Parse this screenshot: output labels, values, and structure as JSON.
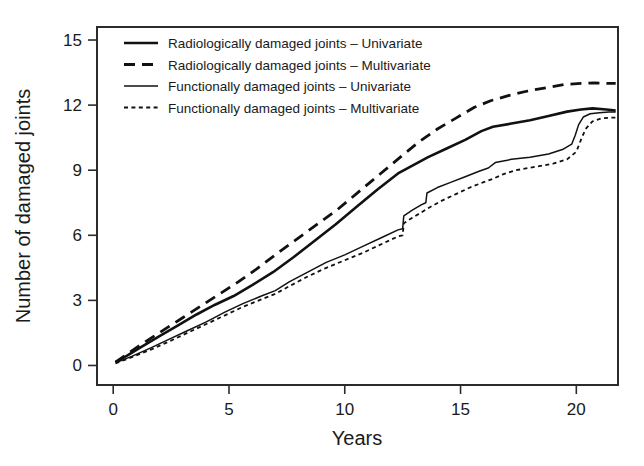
{
  "chart_data": {
    "type": "line",
    "title": "",
    "xlabel": "Years",
    "ylabel": "Number of damaged joints",
    "xlim": [
      -0.7,
      21.8
    ],
    "ylim": [
      -0.9,
      15.6
    ],
    "xticks": [
      0,
      5,
      10,
      15,
      20
    ],
    "xticklabels": [
      "0",
      "5",
      "10",
      "15",
      "20"
    ],
    "yticks": [
      0,
      3,
      6,
      9,
      12,
      15
    ],
    "yticklabels": [
      "0",
      "3",
      "6",
      "9",
      "12",
      "15"
    ],
    "grid": false,
    "legend_position": "top-left-inside",
    "series": [
      {
        "name": "Radiologically damaged joints – Univariate",
        "style": "solid",
        "width": 2.6,
        "color": "#111111",
        "x": [
          0.1,
          0.6,
          1.2,
          2.0,
          2.8,
          3.6,
          4.4,
          5.2,
          6.0,
          6.9,
          7.8,
          8.7,
          9.6,
          10.5,
          11.4,
          12.3,
          12.9,
          13.6,
          14.4,
          15.2,
          15.9,
          16.4,
          17.2,
          18.0,
          18.8,
          19.6,
          20.2,
          20.7,
          21.3,
          21.7
        ],
        "y": [
          0.15,
          0.45,
          0.85,
          1.35,
          1.85,
          2.35,
          2.8,
          3.2,
          3.7,
          4.3,
          5.0,
          5.75,
          6.5,
          7.3,
          8.1,
          8.85,
          9.2,
          9.6,
          10.0,
          10.4,
          10.8,
          11.0,
          11.15,
          11.3,
          11.5,
          11.7,
          11.8,
          11.85,
          11.8,
          11.75
        ]
      },
      {
        "name": "Radiologically damaged joints – Multivariate",
        "style": "dashed",
        "width": 2.8,
        "dash": "11,7",
        "color": "#111111",
        "x": [
          0.1,
          0.7,
          1.4,
          2.2,
          3.0,
          3.8,
          4.6,
          5.4,
          6.2,
          7.0,
          7.9,
          8.8,
          9.7,
          10.6,
          11.5,
          12.4,
          13.2,
          14.0,
          14.8,
          15.6,
          16.3,
          17.1,
          17.9,
          18.7,
          19.5,
          20.2,
          20.8,
          21.4,
          21.7
        ],
        "y": [
          0.15,
          0.6,
          1.1,
          1.65,
          2.2,
          2.75,
          3.3,
          3.85,
          4.45,
          5.1,
          5.8,
          6.5,
          7.2,
          8.0,
          8.8,
          9.6,
          10.3,
          10.9,
          11.4,
          11.9,
          12.2,
          12.45,
          12.65,
          12.8,
          12.95,
          13.0,
          13.02,
          13.0,
          13.0
        ]
      },
      {
        "name": "Functionally damaged joints – Univariate",
        "style": "solid",
        "width": 1.5,
        "color": "#111111",
        "x": [
          0.1,
          0.8,
          1.6,
          2.4,
          3.2,
          4.0,
          4.8,
          5.6,
          6.4,
          7.0,
          7.6,
          8.4,
          9.2,
          10.0,
          10.8,
          11.6,
          12.3,
          12.5,
          12.55,
          12.9,
          13.3,
          13.5,
          13.55,
          14.0,
          14.6,
          15.2,
          15.8,
          16.2,
          16.5,
          17.2,
          18.0,
          18.8,
          19.4,
          19.8,
          19.95,
          20.1,
          20.3,
          20.6,
          21.0,
          21.4,
          21.7
        ],
        "y": [
          0.12,
          0.42,
          0.8,
          1.2,
          1.6,
          2.0,
          2.45,
          2.85,
          3.2,
          3.45,
          3.85,
          4.3,
          4.75,
          5.1,
          5.5,
          5.9,
          6.25,
          6.3,
          6.9,
          7.15,
          7.4,
          7.5,
          7.95,
          8.2,
          8.45,
          8.7,
          8.95,
          9.1,
          9.35,
          9.5,
          9.6,
          9.75,
          9.95,
          10.2,
          10.6,
          11.1,
          11.45,
          11.6,
          11.65,
          11.68,
          11.68
        ]
      },
      {
        "name": "Functionally damaged joints – Multivariate",
        "style": "dotted",
        "width": 1.8,
        "dash": "4,3.4",
        "color": "#111111",
        "x": [
          0.1,
          0.8,
          1.6,
          2.4,
          3.2,
          4.0,
          4.8,
          5.6,
          6.4,
          7.0,
          7.6,
          8.4,
          9.2,
          10.0,
          10.8,
          11.6,
          12.3,
          12.5,
          12.55,
          12.9,
          13.3,
          13.6,
          14.2,
          14.8,
          15.4,
          16.0,
          16.4,
          16.8,
          17.4,
          18.2,
          19.0,
          19.6,
          20.0,
          20.2,
          20.4,
          20.7,
          21.1,
          21.5,
          21.7
        ],
        "y": [
          0.1,
          0.38,
          0.72,
          1.1,
          1.5,
          1.9,
          2.3,
          2.7,
          3.05,
          3.3,
          3.65,
          4.1,
          4.5,
          4.85,
          5.2,
          5.6,
          5.95,
          6.0,
          6.55,
          6.8,
          7.05,
          7.25,
          7.6,
          7.9,
          8.2,
          8.45,
          8.6,
          8.8,
          9.0,
          9.15,
          9.3,
          9.5,
          9.85,
          10.4,
          10.9,
          11.25,
          11.4,
          11.42,
          11.42
        ]
      }
    ]
  },
  "legend": {
    "items": [
      {
        "label": "Radiologically damaged joints – Univariate",
        "style": "solid-thick"
      },
      {
        "label": "Radiologically damaged joints – Multivariate",
        "style": "dashed"
      },
      {
        "label": "Functionally damaged joints – Univariate",
        "style": "solid-thin"
      },
      {
        "label": "Functionally damaged joints – Multivariate",
        "style": "dotted"
      }
    ]
  }
}
